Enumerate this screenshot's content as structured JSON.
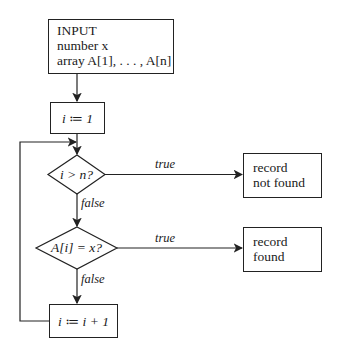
{
  "nodes": {
    "input": {
      "lines": [
        "INPUT",
        "number x",
        "array A[1], . . . , A[n]"
      ]
    },
    "init": {
      "label": "i ≔ 1"
    },
    "check_bound": {
      "label": "i > n?"
    },
    "not_found": {
      "lines": [
        "record",
        "not found"
      ]
    },
    "check_match": {
      "label": "A[i] = x?"
    },
    "found": {
      "lines": [
        "record",
        "found"
      ]
    },
    "increment": {
      "label": "i ≔ i + 1"
    }
  },
  "edges": {
    "bound_true": "true",
    "bound_false": "false",
    "match_true": "true",
    "match_false": "false"
  }
}
